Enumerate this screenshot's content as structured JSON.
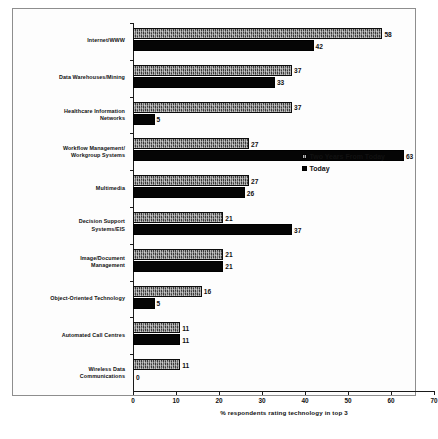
{
  "chart_data": {
    "type": "bar",
    "orientation": "horizontal",
    "title": "",
    "xlabel": "% respondents rating technology in top 3",
    "ylabel": "",
    "xlim": [
      0,
      70
    ],
    "xticks": [
      0,
      10,
      20,
      30,
      40,
      50,
      60,
      70
    ],
    "grid": false,
    "legend_position": "middle-right",
    "categories": [
      "Internet/WWW",
      "Data Warehouses/Mining",
      "Healthcare Information Networks",
      "Workflow Management/ Workgroup Systems",
      "Multimedia",
      "Decision Support Systems/EIS",
      "Image/Document Management",
      "Object-Oriented Technology",
      "Automated Call Centres",
      "Wireless Data Communications"
    ],
    "category_lines": [
      [
        "Internet/WWW"
      ],
      [
        "Data Warehouses/Mining"
      ],
      [
        "Healthcare Information",
        "Networks"
      ],
      [
        "Workflow Management/",
        "Workgroup Systems"
      ],
      [
        "Multimedia"
      ],
      [
        "Decision Support",
        "Systems/EIS"
      ],
      [
        "Image/Document",
        "Management"
      ],
      [
        "Object-Oriented Technology"
      ],
      [
        "Automated Call Centres"
      ],
      [
        "Wireless Data",
        "Communications"
      ]
    ],
    "series": [
      {
        "name": "Two Years From Today",
        "values": [
          58,
          37,
          37,
          27,
          27,
          21,
          21,
          16,
          11,
          11
        ]
      },
      {
        "name": "Today",
        "values": [
          42,
          33,
          5,
          63,
          26,
          37,
          21,
          5,
          11,
          0
        ]
      }
    ]
  },
  "legend": {
    "items": [
      {
        "label": "Two Years From Today",
        "swatch": "future"
      },
      {
        "label": "Today",
        "swatch": "today"
      }
    ]
  }
}
